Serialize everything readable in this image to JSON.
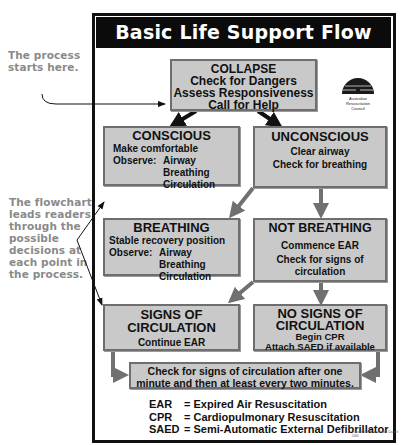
{
  "title": "Basic Life Support Flow Chart",
  "annotations": {
    "start": [
      "The process",
      "starts here."
    ],
    "flow": [
      "The flowchart",
      "leads readers",
      "through the",
      "possible",
      "decisions at",
      "each point in",
      "the process."
    ]
  },
  "logo": {
    "icon": "arc-logo-icon",
    "lines": [
      "Australian",
      "Resuscitation",
      "Council"
    ]
  },
  "nodes": {
    "collapse": {
      "heading": "COLLAPSE",
      "lines": [
        "Check for Dangers",
        "Assess Responsiveness",
        "Call for Help"
      ]
    },
    "conscious": {
      "heading": "CONSCIOUS",
      "action": "Make comfortable",
      "observe_label": "Observe:",
      "observe_items": [
        "Airway",
        "Breathing",
        "Circulation"
      ]
    },
    "unconscious": {
      "heading": "UNCONSCIOUS",
      "lines": [
        "Clear airway",
        "Check for breathing"
      ]
    },
    "breathing": {
      "heading": "BREATHING",
      "action": "Stable recovery position",
      "observe_label": "Observe:",
      "observe_items": [
        "Airway",
        "Breathing",
        "Circulation"
      ]
    },
    "not_breathing": {
      "heading": "NOT BREATHING",
      "lines": [
        "Commence EAR",
        "Check for signs of",
        "circulation"
      ]
    },
    "signs": {
      "heading_1": "SIGNS OF",
      "heading_2": "CIRCULATION",
      "lines": [
        "Continue EAR"
      ]
    },
    "no_signs": {
      "heading_1": "NO SIGNS OF",
      "heading_2": "CIRCULATION",
      "lines": [
        "Begin CPR",
        "Attach SAED if available"
      ]
    },
    "recheck": {
      "lines": [
        "Check for signs of circulation after one",
        "minute and then at least every two minutes."
      ]
    }
  },
  "legend": [
    {
      "abbr": "EAR",
      "meaning": "= Expired Air Resuscitation"
    },
    {
      "abbr": "CPR",
      "meaning": "= Cardiopulmonary Resuscitation"
    },
    {
      "abbr": "SAED",
      "meaning": "= Semi-Automatic External Defibrillator"
    }
  ],
  "copyright": "© Australian Resuscitation Council 2000",
  "colors": {
    "box_fill": "#c9c9c9",
    "box_border": "#6e6e6e",
    "title_bg": "#0b0b0b",
    "annotation_text": "#8a8a8a",
    "arrow_gray": "#707070",
    "arrow_black": "#111111"
  }
}
